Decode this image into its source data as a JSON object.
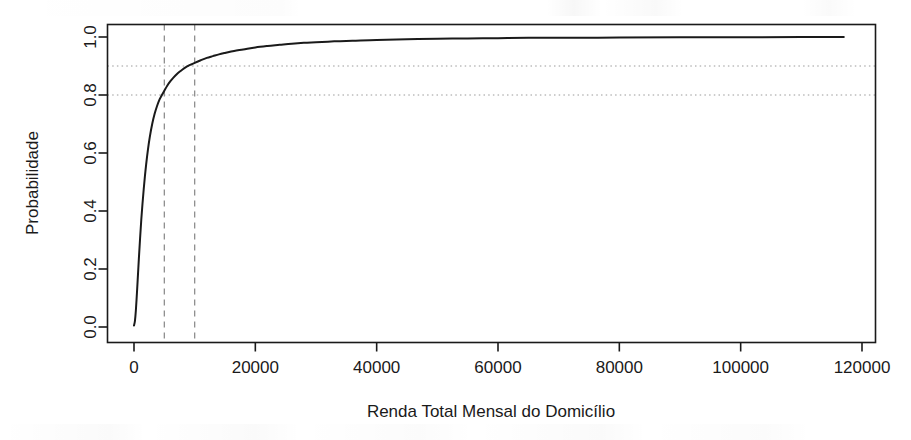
{
  "figure": {
    "name": "cumulative-distribution-household-income",
    "background_color": "#ffffff",
    "ink_color": "#1a1a1a",
    "guide_color": "#8f8f8f"
  },
  "chart_data": {
    "type": "line",
    "title": "",
    "subtitle": "",
    "xlabel": "Renda Total Mensal do Domicílio",
    "ylabel": "Probabilidade",
    "xlim": [
      -4000,
      124000
    ],
    "ylim": [
      0.0,
      1.02
    ],
    "grid": false,
    "legend": null,
    "x_ticks": [
      0,
      20000,
      40000,
      60000,
      80000,
      100000,
      120000
    ],
    "x_tick_labels": [
      "0",
      "20000",
      "40000",
      "60000",
      "80000",
      "100000",
      "120000"
    ],
    "y_ticks": [
      0.0,
      0.2,
      0.4,
      0.6,
      0.8,
      1.0
    ],
    "y_tick_labels": [
      "0.0",
      "0.2",
      "0.4",
      "0.6",
      "0.8",
      "1.0"
    ],
    "series": [
      {
        "name": "Função de distribuição acumulada empírica",
        "style": "solid",
        "color": "#1a1a1a",
        "width": 2,
        "x": [
          0,
          150,
          300,
          450,
          600,
          800,
          1000,
          1200,
          1400,
          1600,
          1800,
          2000,
          2300,
          2600,
          3000,
          3400,
          3800,
          4200,
          4600,
          5000,
          5500,
          6000,
          6500,
          7000,
          7500,
          8000,
          8500,
          9000,
          9500,
          10000,
          11000,
          12000,
          13000,
          14000,
          15000,
          16500,
          18000,
          20000,
          22000,
          24000,
          26000,
          28000,
          30000,
          33000,
          36000,
          40000,
          45000,
          50000,
          55000,
          60000,
          65000,
          70000,
          80000,
          90000,
          100000,
          110000,
          117000
        ],
        "y": [
          0.005,
          0.02,
          0.055,
          0.105,
          0.16,
          0.235,
          0.305,
          0.37,
          0.425,
          0.475,
          0.52,
          0.56,
          0.612,
          0.655,
          0.7,
          0.735,
          0.762,
          0.784,
          0.8,
          0.815,
          0.833,
          0.848,
          0.86,
          0.871,
          0.88,
          0.888,
          0.895,
          0.901,
          0.906,
          0.911,
          0.92,
          0.928,
          0.934,
          0.94,
          0.945,
          0.952,
          0.957,
          0.964,
          0.969,
          0.973,
          0.977,
          0.98,
          0.982,
          0.985,
          0.987,
          0.99,
          0.992,
          0.994,
          0.995,
          0.996,
          0.997,
          0.997,
          0.998,
          0.999,
          0.999,
          1.0,
          1.0
        ]
      }
    ],
    "reference_lines": [
      {
        "name": "vertical-reference-5000",
        "orientation": "vertical",
        "value": 5000,
        "style": "dashed",
        "color": "#8f8f8f"
      },
      {
        "name": "vertical-reference-10000",
        "orientation": "vertical",
        "value": 10000,
        "style": "dashed",
        "color": "#8f8f8f"
      },
      {
        "name": "horizontal-reference-0.8",
        "orientation": "horizontal",
        "value": 0.8,
        "style": "dotted",
        "color": "#9a9a9a"
      },
      {
        "name": "horizontal-reference-0.9",
        "orientation": "horizontal",
        "value": 0.9,
        "style": "dotted",
        "color": "#9a9a9a"
      }
    ],
    "annotations": []
  }
}
